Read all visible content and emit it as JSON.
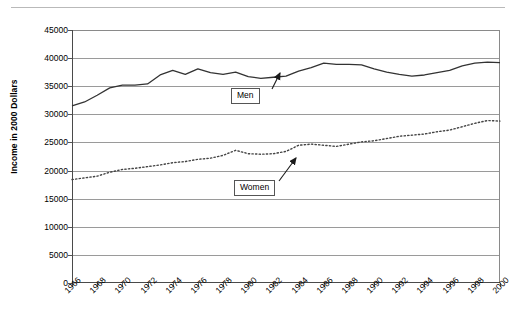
{
  "chart_data": {
    "type": "line",
    "title": "",
    "xlabel": "",
    "ylabel": "Income in 2000 Dollars",
    "ylim": [
      0,
      45000
    ],
    "ytick_values": [
      45000,
      40000,
      35000,
      30000,
      25000,
      20000,
      15000,
      10000,
      5000,
      0
    ],
    "ytick_labels": [
      "45000",
      "40000",
      "35000",
      "30000",
      "25000",
      "20000",
      "15000",
      "10000",
      "5000",
      "0"
    ],
    "grid": true,
    "legend_position": "inline-callouts",
    "x": [
      1966,
      1967,
      1968,
      1969,
      1970,
      1971,
      1972,
      1973,
      1974,
      1975,
      1976,
      1977,
      1978,
      1979,
      1980,
      1981,
      1982,
      1983,
      1984,
      1985,
      1986,
      1987,
      1988,
      1989,
      1990,
      1991,
      1992,
      1993,
      1994,
      1995,
      1996,
      1997,
      1998,
      1999,
      2000
    ],
    "xtick_labels": [
      "1966",
      "1968",
      "1970",
      "1972",
      "1974",
      "1976",
      "1978",
      "1980",
      "1982",
      "1984",
      "1986",
      "1988",
      "1990",
      "1992",
      "1994",
      "1996",
      "1998",
      "2000"
    ],
    "series": [
      {
        "name": "Men",
        "style": "solid",
        "color": "#333333",
        "values": [
          31500,
          32200,
          33400,
          34700,
          35200,
          35200,
          35400,
          37000,
          37800,
          37100,
          38100,
          37400,
          37100,
          37500,
          36700,
          36400,
          36600,
          36800,
          37700,
          38300,
          39100,
          38900,
          38900,
          38800,
          38100,
          37500,
          37100,
          36800,
          37000,
          37400,
          37800,
          38600,
          39100,
          39300,
          39200
        ],
        "label_callout": "Men"
      },
      {
        "name": "Women",
        "style": "dotted",
        "color": "#444444",
        "values": [
          18400,
          18700,
          19000,
          19700,
          20200,
          20400,
          20700,
          21000,
          21400,
          21600,
          22000,
          22200,
          22700,
          23600,
          23000,
          22900,
          23000,
          23400,
          24500,
          24700,
          24500,
          24300,
          24700,
          25100,
          25300,
          25700,
          26100,
          26300,
          26500,
          26900,
          27200,
          27800,
          28400,
          28900,
          28800
        ],
        "label_callout": "Women"
      }
    ]
  },
  "annotations": [
    {
      "name": "men-callout",
      "text": "Men"
    },
    {
      "name": "women-callout",
      "text": "Women"
    }
  ]
}
